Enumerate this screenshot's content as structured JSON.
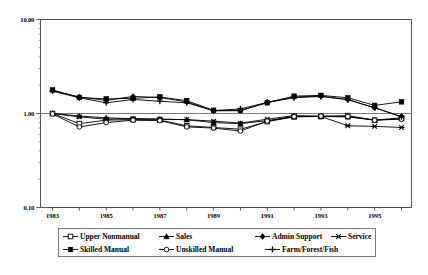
{
  "chart_data": {
    "type": "line",
    "title": "",
    "subtitle": "",
    "xlabel": "",
    "ylabel": "",
    "yscale": "log",
    "ylim": [
      0.1,
      10.0
    ],
    "ytick_labels": [
      "10.00",
      "1.00",
      "0.10"
    ],
    "ytick_values": [
      10.0,
      1.0,
      0.1
    ],
    "grid": false,
    "legend_position": "bottom",
    "x": [
      1983,
      1984,
      1985,
      1986,
      1987,
      1988,
      1989,
      1990,
      1991,
      1992,
      1993,
      1994,
      1995,
      1996
    ],
    "xtick_values": [
      1983,
      1984,
      1985,
      1986,
      1987,
      1988,
      1989,
      1990,
      1991,
      1992,
      1993,
      1994,
      1995,
      1996
    ],
    "xtick_labels": [
      "1983",
      "",
      "1985",
      "",
      "1987",
      "",
      "1989",
      "",
      "1991",
      "",
      "1993",
      "",
      "1995",
      ""
    ],
    "series": [
      {
        "name": "Upper Nonmanual",
        "marker": "open-square",
        "values": [
          1.0,
          0.78,
          0.85,
          0.86,
          0.85,
          0.74,
          0.71,
          0.68,
          0.82,
          0.92,
          0.93,
          0.95,
          0.85,
          0.9
        ]
      },
      {
        "name": "Sales",
        "marker": "filled-triangle",
        "values": [
          1.0,
          0.94,
          0.9,
          0.88,
          0.87,
          0.86,
          0.8,
          0.78,
          0.84,
          0.93,
          0.93,
          0.92,
          0.85,
          0.88
        ]
      },
      {
        "name": "Admin Support",
        "marker": "filled-diamond",
        "values": [
          1.75,
          1.5,
          1.38,
          1.52,
          1.48,
          1.33,
          1.07,
          1.07,
          1.32,
          1.5,
          1.53,
          1.41,
          1.15,
          0.93
        ]
      },
      {
        "name": "Service",
        "marker": "star-x",
        "values": [
          1.0,
          0.92,
          0.87,
          0.88,
          0.87,
          0.86,
          0.83,
          0.79,
          0.87,
          0.95,
          0.93,
          0.74,
          0.73,
          0.71
        ]
      },
      {
        "name": "Skilled Manual",
        "marker": "filled-square",
        "values": [
          1.78,
          1.48,
          1.43,
          1.45,
          1.5,
          1.37,
          1.08,
          1.08,
          1.3,
          1.53,
          1.56,
          1.47,
          1.22,
          1.33
        ]
      },
      {
        "name": "Unskilled Manual",
        "marker": "open-circle",
        "values": [
          0.99,
          0.72,
          0.8,
          0.85,
          0.84,
          0.72,
          0.7,
          0.65,
          0.83,
          0.93,
          0.94,
          0.93,
          0.85,
          0.87
        ]
      },
      {
        "name": "Farm/Forest/Fish",
        "marker": "plus",
        "values": [
          1.73,
          1.47,
          1.3,
          1.41,
          1.35,
          1.3,
          1.07,
          1.12,
          1.31,
          1.47,
          1.52,
          1.4,
          1.15,
          0.92
        ]
      }
    ]
  },
  "axes": {
    "y_ticks": [
      {
        "label": "10.00",
        "value": 10.0
      },
      {
        "label": "1.00",
        "value": 1.0
      },
      {
        "label": "0.10",
        "value": 0.1
      }
    ],
    "x_ticks": [
      {
        "label": "1983",
        "value": 1983
      },
      {
        "label": "1985",
        "value": 1985
      },
      {
        "label": "1987",
        "value": 1987
      },
      {
        "label": "1989",
        "value": 1989
      },
      {
        "label": "1991",
        "value": 1991
      },
      {
        "label": "1993",
        "value": 1993
      },
      {
        "label": "1995",
        "value": 1995
      }
    ]
  },
  "legend": {
    "row1": [
      {
        "label": "Upper Nonmanual",
        "marker": "open-square"
      },
      {
        "label": "Sales",
        "marker": "filled-triangle"
      },
      {
        "label": "Admin Support",
        "marker": "filled-diamond"
      },
      {
        "label": "Service",
        "marker": "star-x"
      }
    ],
    "row2": [
      {
        "label": "Skilled Manual",
        "marker": "filled-square"
      },
      {
        "label": "Unskilled Manual",
        "marker": "open-circle"
      },
      {
        "label": "Farm/Forest/Fish",
        "marker": "plus"
      }
    ]
  },
  "colors": {
    "line": "#000000",
    "frame": "#555555",
    "background": "#ffffff"
  }
}
